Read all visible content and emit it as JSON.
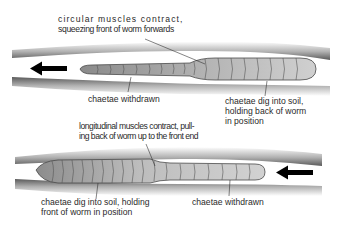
{
  "diagram": {
    "stage1": {
      "direction": "left",
      "labels": {
        "circular_line1": "circular muscles contract,",
        "circular_line2": "squeezing front of worm forwards",
        "withdrawn": "chaetae withdrawn",
        "dig_line1": "chaetae dig into soil,",
        "dig_line2": "holding back of worm",
        "dig_line3": "in position"
      }
    },
    "stage2": {
      "direction": "right-to-left",
      "labels": {
        "longitudinal_line1": "longitudinal muscles contract, pull-",
        "longitudinal_line2": "ing back of worm up to the front end",
        "dig_line1": "chaetae dig into soil, holding",
        "dig_line2": "front of worm in position",
        "withdrawn": "chaetae withdrawn"
      }
    },
    "colors": {
      "soil": "#6a6a6a",
      "worm_dark": "#8a8a8a",
      "worm_light": "#c9c9c9",
      "segment_line": "#4a4a4a",
      "arrow": "#000000"
    }
  }
}
